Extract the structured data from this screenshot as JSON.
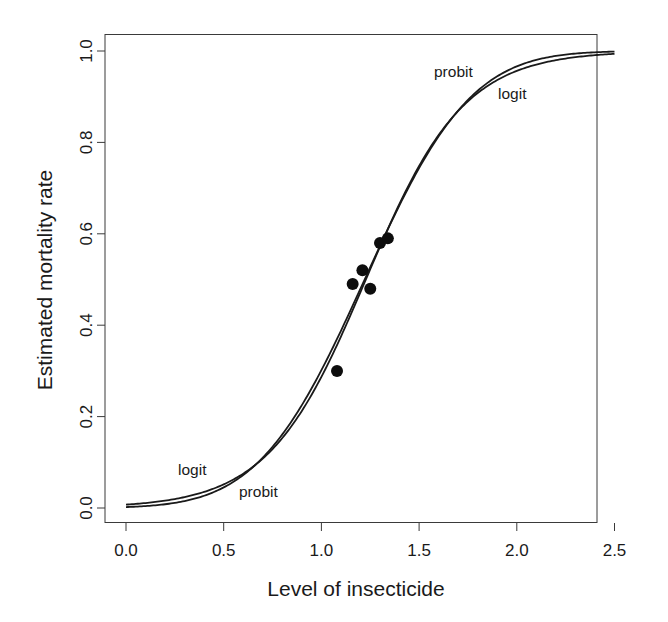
{
  "chart_data": {
    "type": "line",
    "title": "",
    "xlabel": "Level of insecticide",
    "ylabel": "Estimated mortality rate",
    "xlim": [
      0.0,
      2.5
    ],
    "ylim": [
      0.0,
      1.0
    ],
    "grid": false,
    "legend": "none (curves labeled inline)",
    "x_ticks": [
      0.0,
      0.5,
      1.0,
      1.5,
      2.0,
      2.5
    ],
    "x_tick_labels": [
      "0.0",
      "0.5",
      "1.0",
      "1.5",
      "2.0",
      "2.5"
    ],
    "y_ticks": [
      0.0,
      0.2,
      0.4,
      0.6,
      0.8,
      1.0
    ],
    "y_tick_labels": [
      "0.0",
      "0.2",
      "0.4",
      "0.6",
      "0.8",
      "1.0"
    ],
    "series": [
      {
        "name": "logit",
        "kind": "fitted-curve",
        "model": "logistic",
        "intercept": -4.91,
        "slope": 4.0,
        "x": [
          0.0,
          0.25,
          0.5,
          0.75,
          1.0,
          1.25,
          1.5,
          1.75,
          2.0,
          2.25,
          2.5
        ],
        "values": [
          0.007,
          0.02,
          0.05,
          0.13,
          0.29,
          0.52,
          0.75,
          0.89,
          0.96,
          0.98,
          0.99
        ]
      },
      {
        "name": "probit",
        "kind": "fitted-curve",
        "model": "probit",
        "intercept": -2.87,
        "slope": 2.35,
        "x": [
          0.0,
          0.25,
          0.5,
          0.75,
          1.0,
          1.25,
          1.5,
          1.75,
          2.0,
          2.25,
          2.5
        ],
        "values": [
          0.002,
          0.008,
          0.03,
          0.11,
          0.28,
          0.52,
          0.76,
          0.91,
          0.98,
          0.995,
          0.999
        ]
      },
      {
        "name": "observed",
        "kind": "scatter",
        "x": [
          1.08,
          1.16,
          1.21,
          1.25,
          1.3,
          1.34
        ],
        "values": [
          0.3,
          0.49,
          0.52,
          0.48,
          0.58,
          0.59
        ]
      }
    ],
    "annotations": [
      {
        "text": "logit",
        "x": 0.27,
        "y": 0.07
      },
      {
        "text": "probit",
        "x": 0.58,
        "y": 0.02
      },
      {
        "text": "probit",
        "x": 1.58,
        "y": 0.95
      },
      {
        "text": "logit",
        "x": 1.9,
        "y": 0.9
      }
    ]
  },
  "labels": {
    "xlabel": "Level of insecticide",
    "ylabel": "Estimated mortality rate",
    "x_ticks": [
      "0.0",
      "0.5",
      "1.0",
      "1.5",
      "2.0",
      "2.5"
    ],
    "y_ticks": [
      "0.0",
      "0.2",
      "0.4",
      "0.6",
      "0.8",
      "1.0"
    ],
    "curve_labels": {
      "logit_low": "logit",
      "probit_low": "probit",
      "probit_high": "probit",
      "logit_high": "logit"
    }
  }
}
